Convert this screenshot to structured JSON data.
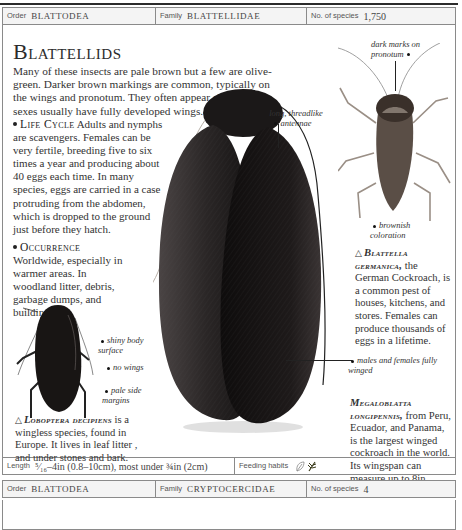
{
  "header": {
    "order_label": "Order",
    "order_value": "Blattodea",
    "family_label": "Family",
    "family_value": "Blattellidae",
    "species_label": "No. of species",
    "species_value": "1,750"
  },
  "main": {
    "title": "Blattellids",
    "intro": "Many of these insects are pale brown but a few are olive-green. Darker brown markings are common, typically on the wings and pronotum. They often appear shiny. Both sexes usually have fully developed wings.",
    "life_cycle_head": "Life Cycle",
    "life_cycle_text": "Adults and nymphs are scavengers. Females can be very fertile, breeding five to six times a year and producing about 40 eggs each time. In many species, eggs are carried in a case protruding from the abdomen, which is dropped to the ground just before they hatch.",
    "occurrence_head": "Occurrence",
    "occurrence_text": "Worldwide, especially in warmer areas. In woodland litter, debris, garbage dumps, and buildings."
  },
  "annotations": {
    "dark_marks": "dark marks on pronotum",
    "antennae": "long, threadlike antennae",
    "brownish": "brownish coloration",
    "shiny": "shiny body surface",
    "no_wings": "no wings",
    "pale_margins": "pale side margins",
    "males_females": "males and females fully winged"
  },
  "captions": {
    "blattella_species": "Blattella germanica,",
    "blattella_text": "the German Cockroach, is a common pest of houses, kitchens, and stores. Females can produce thousands of eggs in a lifetime.",
    "loboptera_species": "Loboptera decipiens",
    "loboptera_text": "is a wingless species, found in Europe. It lives in leaf litter , and under stones and bark.",
    "megaloblatta_species": "Megaloblatta longipennis,",
    "megaloblatta_text": "from Peru, Ecuador, and Panama, is the largest winged cockroach in the world. Its wingspan can measure up to 8in (20cm).",
    "triangle": "△"
  },
  "footer": {
    "length_label": "Length",
    "length_value": "⁵⁄₁₆–4in (0.8–10cm), most under ¾in (2cm)",
    "feeding_label": "Feeding habits",
    "feeding_icons": [
      "leaf-outline-icon",
      "plant-sprig-icon"
    ]
  },
  "next_entry": {
    "order_label": "Order",
    "order_value": "Blattodea",
    "family_label": "Family",
    "family_value": "Cryptocercidae",
    "species_label": "No. of species",
    "species_value": "4"
  },
  "colors": {
    "border": "#8a8a8a",
    "header_bg": "#f4f4f4",
    "insect_dark": "#1c1a1a",
    "insect_brown": "#4a3e36"
  }
}
